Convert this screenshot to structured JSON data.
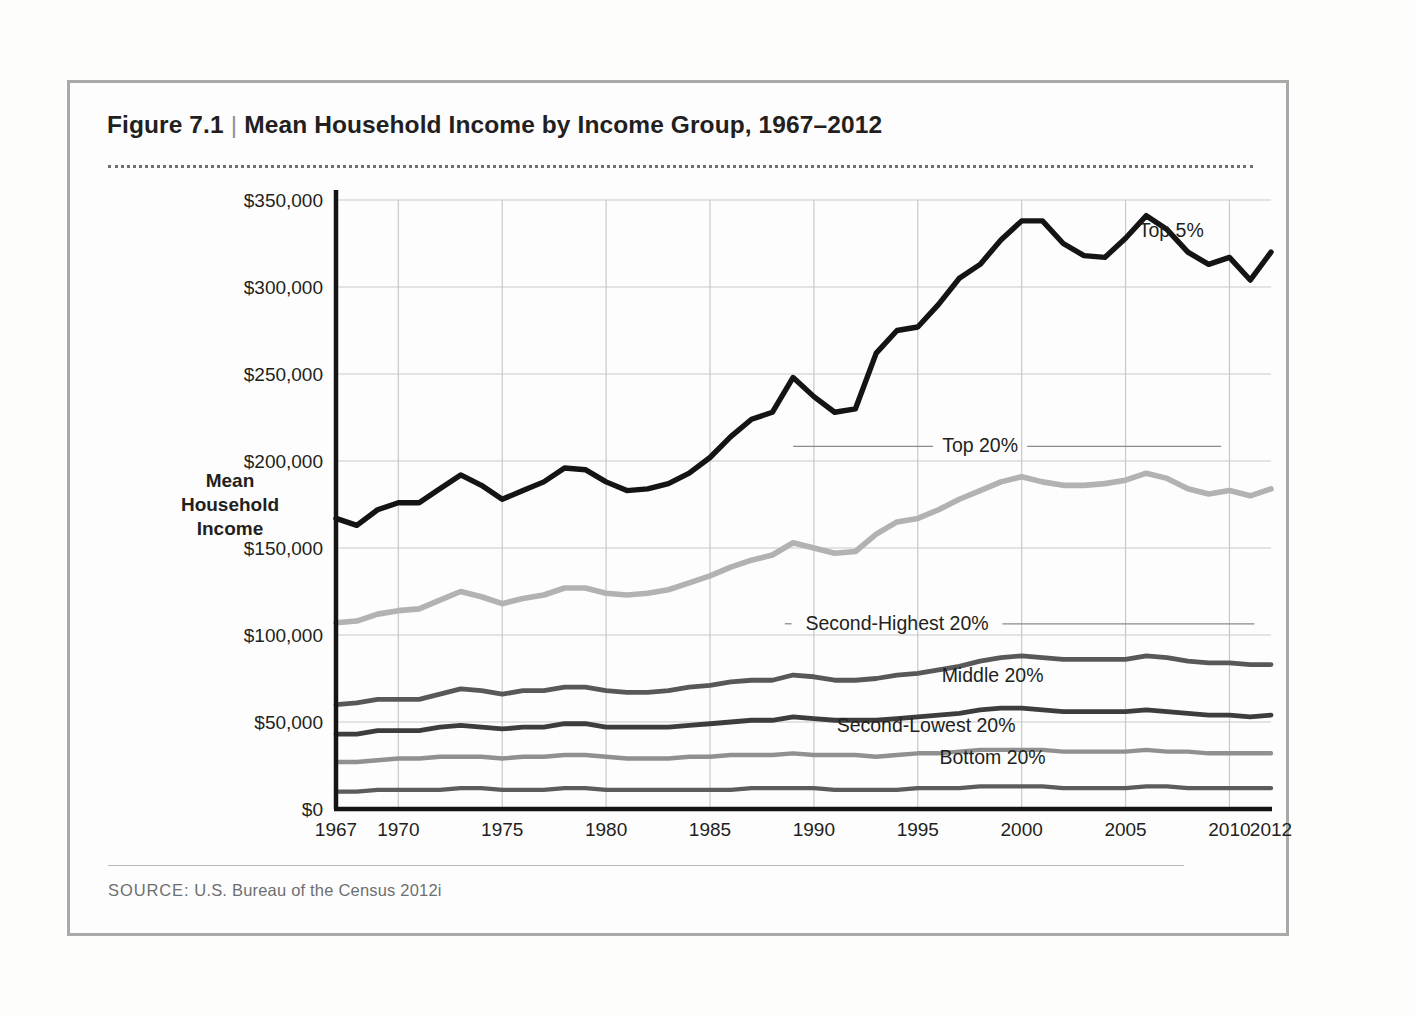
{
  "figure": {
    "number": "Figure 7.1",
    "separator": "|",
    "title": "Mean Household Income by Income Group, 1967–2012",
    "source_label": "SOURCE:",
    "source_text": " U.S. Bureau of the Census 2012i"
  },
  "chart_data": {
    "type": "line",
    "title": "Mean Household Income by Income Group, 1967–2012",
    "xlabel": "",
    "ylabel": "Mean Household Income",
    "ylabel_lines": [
      "Mean",
      "Household",
      "Income"
    ],
    "xlim": [
      1967,
      2012
    ],
    "ylim": [
      0,
      350000
    ],
    "grid": true,
    "legend_position": "right-inline-labels",
    "y_ticks": [
      0,
      50000,
      100000,
      150000,
      200000,
      250000,
      300000,
      350000
    ],
    "y_tick_labels": [
      "$0",
      "$50,000",
      "$100,000",
      "$150,000",
      "$200,000",
      "$250,000",
      "$300,000",
      "$350,000"
    ],
    "x_ticks": [
      1967,
      1970,
      1975,
      1980,
      1985,
      1990,
      1995,
      2000,
      2005,
      2010,
      2012
    ],
    "x_tick_labels": [
      "1967",
      "1970",
      "1975",
      "1980",
      "1985",
      "1990",
      "1995",
      "2000",
      "2005",
      "2010",
      "2012"
    ],
    "x_gridlines": [
      1970,
      1975,
      1980,
      1985,
      1990,
      1995,
      2000,
      2005,
      2010
    ],
    "x": [
      1967,
      1968,
      1969,
      1970,
      1971,
      1972,
      1973,
      1974,
      1975,
      1976,
      1977,
      1978,
      1979,
      1980,
      1981,
      1982,
      1983,
      1984,
      1985,
      1986,
      1987,
      1988,
      1989,
      1990,
      1991,
      1992,
      1993,
      1994,
      1995,
      1996,
      1997,
      1998,
      1999,
      2000,
      2001,
      2002,
      2003,
      2004,
      2005,
      2006,
      2007,
      2008,
      2009,
      2010,
      2011,
      2012
    ],
    "series": [
      {
        "name": "Top 5%",
        "color": "#141414",
        "width": 5.4,
        "label_x": 2007.2,
        "label_y": 329000,
        "leader": false,
        "values": [
          167000,
          163000,
          172000,
          176000,
          176000,
          184000,
          192000,
          186000,
          178000,
          183000,
          188000,
          196000,
          195000,
          188000,
          183000,
          184000,
          187000,
          193000,
          202000,
          214000,
          224000,
          228000,
          248000,
          237000,
          228000,
          230000,
          262000,
          275000,
          277000,
          290000,
          305000,
          313000,
          327000,
          338000,
          338000,
          325000,
          318000,
          317000,
          328000,
          341000,
          333000,
          320000,
          313000,
          317000,
          304000,
          320000
        ]
      },
      {
        "name": "Top 20%",
        "color": "#b2b2b2",
        "width": 5.6,
        "label_x": 1998.0,
        "label_y": 205000,
        "leader": true,
        "leader_left_x": 1989.0,
        "leader_right_x": 2009.6,
        "values": [
          107000,
          108000,
          112000,
          114000,
          115000,
          120000,
          125000,
          122000,
          118000,
          121000,
          123000,
          127000,
          127000,
          124000,
          123000,
          124000,
          126000,
          130000,
          134000,
          139000,
          143000,
          146000,
          153000,
          150000,
          147000,
          148000,
          158000,
          165000,
          167000,
          172000,
          178000,
          183000,
          188000,
          191000,
          188000,
          186000,
          186000,
          187000,
          189000,
          193000,
          190000,
          184000,
          181000,
          183000,
          180000,
          184000
        ]
      },
      {
        "name": "Second-Highest 20%",
        "color": "#585858",
        "width": 4.8,
        "label_x": 1994.0,
        "label_y": 103000,
        "leader": true,
        "leader_left_x": 1988.6,
        "leader_right_x": 2011.2,
        "values": [
          60000,
          61000,
          63000,
          63000,
          63000,
          66000,
          69000,
          68000,
          66000,
          68000,
          68000,
          70000,
          70000,
          68000,
          67000,
          67000,
          68000,
          70000,
          71000,
          73000,
          74000,
          74000,
          77000,
          76000,
          74000,
          74000,
          75000,
          77000,
          78000,
          80000,
          82000,
          85000,
          87000,
          88000,
          87000,
          86000,
          86000,
          86000,
          86000,
          88000,
          87000,
          85000,
          84000,
          84000,
          83000,
          83000
        ]
      },
      {
        "name": "Middle 20%",
        "color": "#3d3d3d",
        "width": 4.8,
        "label_x": 1998.6,
        "label_y": 73000,
        "leader": false,
        "values": [
          43000,
          43000,
          45000,
          45000,
          45000,
          47000,
          48000,
          47000,
          46000,
          47000,
          47000,
          49000,
          49000,
          47000,
          47000,
          47000,
          47000,
          48000,
          49000,
          50000,
          51000,
          51000,
          53000,
          52000,
          51000,
          51000,
          51000,
          52000,
          53000,
          54000,
          55000,
          57000,
          58000,
          58000,
          57000,
          56000,
          56000,
          56000,
          56000,
          57000,
          56000,
          55000,
          54000,
          54000,
          53000,
          54000
        ]
      },
      {
        "name": "Second-Lowest 20%",
        "color": "#909090",
        "width": 4.4,
        "label_x": 1995.4,
        "label_y": 44000,
        "leader": false,
        "values": [
          27000,
          27000,
          28000,
          29000,
          29000,
          30000,
          30000,
          30000,
          29000,
          30000,
          30000,
          31000,
          31000,
          30000,
          29000,
          29000,
          29000,
          30000,
          30000,
          31000,
          31000,
          31000,
          32000,
          31000,
          31000,
          31000,
          30000,
          31000,
          32000,
          32000,
          33000,
          34000,
          34000,
          34000,
          34000,
          33000,
          33000,
          33000,
          33000,
          34000,
          33000,
          33000,
          32000,
          32000,
          32000,
          32000
        ]
      },
      {
        "name": "Bottom 20%",
        "color": "#5c5c5c",
        "width": 4.4,
        "label_x": 1998.6,
        "label_y": 26000,
        "leader": false,
        "values": [
          10000,
          10000,
          11000,
          11000,
          11000,
          11000,
          12000,
          12000,
          11000,
          11000,
          11000,
          12000,
          12000,
          11000,
          11000,
          11000,
          11000,
          11000,
          11000,
          11000,
          12000,
          12000,
          12000,
          12000,
          11000,
          11000,
          11000,
          11000,
          12000,
          12000,
          12000,
          13000,
          13000,
          13000,
          13000,
          12000,
          12000,
          12000,
          12000,
          13000,
          13000,
          12000,
          12000,
          12000,
          12000,
          12000
        ]
      }
    ]
  }
}
